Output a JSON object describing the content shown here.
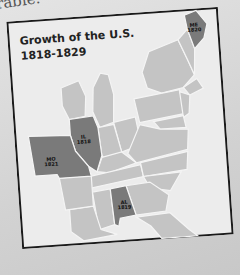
{
  "page": {
    "bleed_text": "rable."
  },
  "map": {
    "title_line1": "Growth of the U.S.",
    "title_line2": "1818-1829",
    "colors": {
      "new_state": "#7a7a7a",
      "existing_state": "#c4c4c4",
      "water": "#ececec",
      "border": "#f4f4f4",
      "frame": "#1a1a1a"
    },
    "highlighted_states": [
      {
        "abbr": "ME",
        "year": "1820"
      },
      {
        "abbr": "IL",
        "year": "1818"
      },
      {
        "abbr": "MO",
        "year": "1821"
      },
      {
        "abbr": "AL",
        "year": "1819"
      }
    ]
  }
}
